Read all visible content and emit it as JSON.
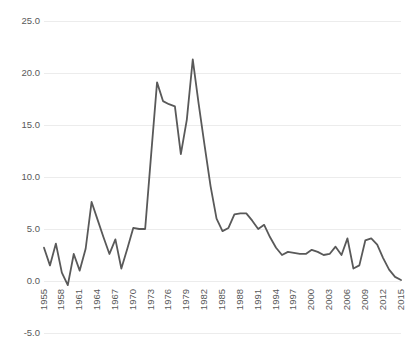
{
  "chart_data": {
    "type": "line",
    "title": "",
    "subtitle": "",
    "xlabel": "",
    "ylabel": "",
    "ylim": [
      -5.0,
      25.0
    ],
    "xlim": [
      1955,
      2015
    ],
    "grid": true,
    "legend": false,
    "legend_position": "none",
    "line_color": "#595959",
    "grid_color": "#ececec",
    "background_color": "#ffffff",
    "y_ticks": [
      25.0,
      20.0,
      15.0,
      10.0,
      5.0,
      0.0,
      -5.0
    ],
    "y_tick_labels": [
      "25.0",
      "20.0",
      "15.0",
      "10.0",
      "5.0",
      "0.0",
      "-5.0"
    ],
    "x_ticks": [
      1955,
      1958,
      1961,
      1964,
      1967,
      1970,
      1973,
      1976,
      1979,
      1982,
      1985,
      1988,
      1991,
      1994,
      1997,
      2000,
      2003,
      2006,
      2009,
      2012,
      2015
    ],
    "x_tick_labels": [
      "1955",
      "1958",
      "1961",
      "1964",
      "1967",
      "1970",
      "1973",
      "1976",
      "1979",
      "1982",
      "1985",
      "1988",
      "1991",
      "1994",
      "1997",
      "2000",
      "2003",
      "2006",
      "2009",
      "2012",
      "2015"
    ],
    "x_tick_rotation": -90,
    "x": [
      1955,
      1956,
      1957,
      1958,
      1959,
      1960,
      1961,
      1962,
      1963,
      1964,
      1965,
      1966,
      1967,
      1968,
      1969,
      1970,
      1971,
      1972,
      1973,
      1974,
      1975,
      1976,
      1977,
      1978,
      1979,
      1980,
      1981,
      1982,
      1983,
      1984,
      1985,
      1986,
      1987,
      1988,
      1989,
      1990,
      1991,
      1992,
      1993,
      1994,
      1995,
      1996,
      1997,
      1998,
      1999,
      2000,
      2001,
      2002,
      2003,
      2004,
      2005,
      2006,
      2007,
      2008,
      2009,
      2010,
      2011,
      2012,
      2013,
      2014,
      2015
    ],
    "y": [
      3.2,
      1.5,
      3.6,
      0.8,
      -0.4,
      2.6,
      1.0,
      3.1,
      7.6,
      5.9,
      4.2,
      2.6,
      4.0,
      1.2,
      3.1,
      5.1,
      5.0,
      5.0,
      12.1,
      19.1,
      17.3,
      17.0,
      16.8,
      12.2,
      15.5,
      21.3,
      17.0,
      13.0,
      9.1,
      6.0,
      4.8,
      5.1,
      6.4,
      6.5,
      6.5,
      5.8,
      5.0,
      5.4,
      4.2,
      3.2,
      2.5,
      2.8,
      2.7,
      2.6,
      2.6,
      3.0,
      2.8,
      2.5,
      2.6,
      3.3,
      2.5,
      4.1,
      1.2,
      1.5,
      3.9,
      4.1,
      3.5,
      2.2,
      1.1,
      0.4,
      0.1
    ],
    "series": [
      {
        "name": "series-1",
        "values": [
          3.2,
          1.5,
          3.6,
          0.8,
          -0.4,
          2.6,
          1.0,
          3.1,
          7.6,
          5.9,
          4.2,
          2.6,
          4.0,
          1.2,
          3.1,
          5.1,
          5.0,
          5.0,
          12.1,
          19.1,
          17.3,
          17.0,
          16.8,
          12.2,
          15.5,
          21.3,
          17.0,
          13.0,
          9.1,
          6.0,
          4.8,
          5.1,
          6.4,
          6.5,
          6.5,
          5.8,
          5.0,
          5.4,
          4.2,
          3.2,
          2.5,
          2.8,
          2.7,
          2.6,
          2.6,
          3.0,
          2.8,
          2.5,
          2.6,
          3.3,
          2.5,
          4.1,
          1.2,
          1.5,
          3.9,
          4.1,
          3.5,
          2.2,
          1.1,
          0.4,
          0.1
        ]
      }
    ],
    "annotations": []
  }
}
